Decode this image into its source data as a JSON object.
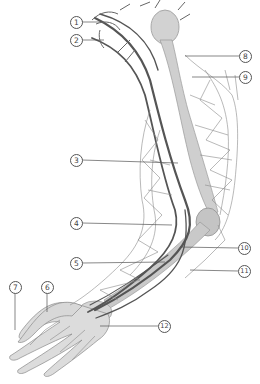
{
  "figure": {
    "colors": {
      "background": "#ffffff",
      "bone": "#cfcfcf",
      "vessel": "#5a5a5a",
      "network": "#8a8a8a",
      "leader": "#555555"
    }
  },
  "labels": [
    {
      "id": "1",
      "text": "1",
      "x": 76,
      "y": 22
    },
    {
      "id": "2",
      "text": "2",
      "x": 76,
      "y": 40
    },
    {
      "id": "3",
      "text": "3",
      "x": 76,
      "y": 160
    },
    {
      "id": "4",
      "text": "4",
      "x": 76,
      "y": 223
    },
    {
      "id": "5",
      "text": "5",
      "x": 76,
      "y": 263
    },
    {
      "id": "6",
      "text": "6",
      "x": 47,
      "y": 287
    },
    {
      "id": "7",
      "text": "7",
      "x": 15,
      "y": 287
    },
    {
      "id": "8",
      "text": "8",
      "x": 245,
      "y": 56
    },
    {
      "id": "9",
      "text": "9",
      "x": 245,
      "y": 77
    },
    {
      "id": "10",
      "text": "10",
      "x": 244,
      "y": 248
    },
    {
      "id": "11",
      "text": "11",
      "x": 244,
      "y": 271
    },
    {
      "id": "12",
      "text": "12",
      "x": 164,
      "y": 326
    }
  ]
}
